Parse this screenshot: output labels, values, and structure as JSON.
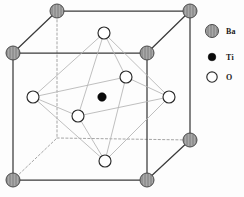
{
  "figure": {
    "background_color": "#fdfdfd"
  },
  "colors": {
    "cube_edge": "#3b3b3b",
    "cube_edge_hidden": "#9b9b9b",
    "octahedron_edge": "#b3b3b3",
    "ba_fill": "#a8a8a8",
    "ba_stroke": "#4a4a4a",
    "ba_hatch": "#8a8a8a",
    "ti_fill": "#0a0a0a",
    "ti_stroke": "#000000",
    "o_fill": "#ffffff",
    "o_stroke": "#2a2a2a",
    "label_text": "#1a1a1a"
  },
  "legend": {
    "items": [
      {
        "symbol": "ba-sphere-icon",
        "label": "Ba",
        "x": 212,
        "y": 31,
        "r": 6.5,
        "label_x": 226,
        "label_y": 34
      },
      {
        "symbol": "ti-sphere-icon",
        "label": "Ti",
        "x": 212,
        "y": 57,
        "r": 3.8,
        "label_x": 226,
        "label_y": 60
      },
      {
        "symbol": "o-sphere-icon",
        "label": "O",
        "x": 212,
        "y": 77,
        "r": 5.2,
        "label_x": 226,
        "label_y": 80
      }
    ]
  },
  "cube": {
    "vertices": {
      "front_top_left": {
        "x": 13,
        "y": 53
      },
      "front_top_right": {
        "x": 147,
        "y": 53
      },
      "front_bot_left": {
        "x": 13,
        "y": 180
      },
      "front_bot_right": {
        "x": 147,
        "y": 180
      },
      "back_top_left": {
        "x": 57,
        "y": 11
      },
      "back_top_right": {
        "x": 190,
        "y": 11
      },
      "back_bot_left": {
        "x": 57,
        "y": 138
      },
      "back_bot_right": {
        "x": 190,
        "y": 140
      }
    },
    "solid_edges": [
      [
        "front_top_left",
        "front_top_right"
      ],
      [
        "front_top_left",
        "front_bot_left"
      ],
      [
        "front_top_right",
        "front_bot_right"
      ],
      [
        "front_bot_left",
        "front_bot_right"
      ],
      [
        "back_top_left",
        "back_top_right"
      ],
      [
        "back_top_right",
        "back_bot_right"
      ],
      [
        "front_top_left",
        "back_top_left"
      ],
      [
        "front_top_right",
        "back_top_right"
      ],
      [
        "front_bot_right",
        "back_bot_right"
      ]
    ],
    "hidden_edges": [
      [
        "back_top_left",
        "back_bot_left"
      ],
      [
        "back_bot_left",
        "back_bot_right"
      ],
      [
        "front_bot_left",
        "back_bot_left"
      ]
    ]
  },
  "atoms": {
    "ba": {
      "name": "Ba",
      "radius": 7,
      "positions": [
        {
          "id": "ba-back-top-left",
          "x": 57,
          "y": 11
        },
        {
          "id": "ba-back-top-right",
          "x": 190,
          "y": 11
        },
        {
          "id": "ba-front-top-left",
          "x": 13,
          "y": 53
        },
        {
          "id": "ba-front-top-right",
          "x": 147,
          "y": 53
        },
        {
          "id": "ba-back-bot-right",
          "x": 190,
          "y": 140
        },
        {
          "id": "ba-front-bot-left",
          "x": 13,
          "y": 180
        },
        {
          "id": "ba-front-bot-right",
          "x": 147,
          "y": 180
        }
      ]
    },
    "ti": {
      "name": "Ti",
      "radius": 4.2,
      "positions": [
        {
          "id": "ti-body-center",
          "x": 102,
          "y": 97
        }
      ]
    },
    "o": {
      "name": "O",
      "radius": 6,
      "positions": [
        {
          "id": "o-top",
          "x": 104,
          "y": 33
        },
        {
          "id": "o-left",
          "x": 33,
          "y": 97
        },
        {
          "id": "o-right",
          "x": 169,
          "y": 97
        },
        {
          "id": "o-bottom",
          "x": 105,
          "y": 161
        },
        {
          "id": "o-inner-back",
          "x": 126,
          "y": 77
        },
        {
          "id": "o-inner-front",
          "x": 78,
          "y": 116
        }
      ]
    }
  },
  "octahedron": {
    "edges": [
      [
        "o-top",
        "o-left"
      ],
      [
        "o-top",
        "o-right"
      ],
      [
        "o-top",
        "o-inner-back"
      ],
      [
        "o-top",
        "o-inner-front"
      ],
      [
        "o-bottom",
        "o-left"
      ],
      [
        "o-bottom",
        "o-right"
      ],
      [
        "o-bottom",
        "o-inner-back"
      ],
      [
        "o-bottom",
        "o-inner-front"
      ],
      [
        "o-left",
        "o-inner-back"
      ],
      [
        "o-left",
        "o-inner-front"
      ],
      [
        "o-right",
        "o-inner-back"
      ],
      [
        "o-right",
        "o-inner-front"
      ]
    ]
  }
}
